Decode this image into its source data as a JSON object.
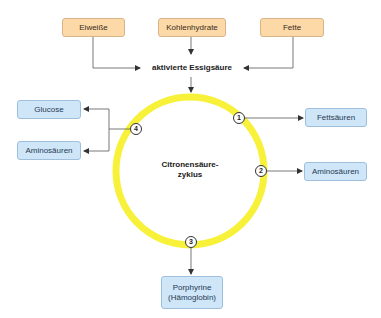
{
  "diagram": {
    "colors": {
      "cycle_ring": "#f7f13a",
      "input_box": "#fcd9a7",
      "output_box": "#cfe6f8",
      "arrow": "#333333"
    },
    "inputs": [
      {
        "label": "Eiweiße"
      },
      {
        "label": "Kohlenhydrate"
      },
      {
        "label": "Fette"
      }
    ],
    "hub": {
      "label": "aktivierte Essigsäure"
    },
    "cycle": {
      "label_line1": "Citronensäure-",
      "label_line2": "zyklus"
    },
    "nodes": [
      {
        "number": "1"
      },
      {
        "number": "2"
      },
      {
        "number": "3"
      },
      {
        "number": "4"
      }
    ],
    "outputs": {
      "node1": {
        "label": "Fettsäuren"
      },
      "node2": {
        "label": "Aminosäuren"
      },
      "node3": {
        "label_line1": "Porphyrine",
        "label_line2": "(Hämoglobin)"
      },
      "node4": [
        {
          "label": "Glucose"
        },
        {
          "label": "Aminosäuren"
        }
      ]
    }
  }
}
